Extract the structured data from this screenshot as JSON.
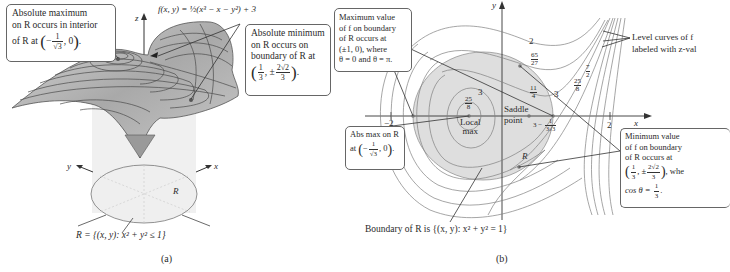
{
  "figure": {
    "panel_a": {
      "caption": "(a)",
      "function_label": "f(x, y) = ½(x³ − x − y²) + 3",
      "axis_labels": {
        "z": "z",
        "x": "x",
        "y": "y"
      },
      "region_label": "R",
      "region_definition": "R = {(x, y): x² + y² ≤ 1}",
      "callouts": {
        "abs_max": {
          "line1": "Absolute maximum",
          "line2": "on R occurs in interior",
          "line3_prefix": "of R at",
          "point_num": "1",
          "point_den": "√3",
          "point_sign": "−",
          "point_suffix": ", 0",
          "end": "."
        },
        "abs_min": {
          "line1": "Absolute minimum",
          "line2": "on R occurs on",
          "line3": "boundary of R at",
          "x_num": "1",
          "x_den": "3",
          "y_sign": "±",
          "y_num": "2√2",
          "y_den": "3",
          "end": "."
        }
      }
    },
    "panel_b": {
      "caption": "(b)",
      "axis_labels": {
        "x": "x",
        "y": "y"
      },
      "ticks": {
        "neg2": "−2",
        "pos2": "2",
        "half": "1/2"
      },
      "region_label": "R",
      "boundary_text": "Boundary of R is {(x, y): x² + y² = 1}",
      "point_labels": {
        "local_max": [
          "Local",
          "max"
        ],
        "saddle": [
          "Saddle",
          "point"
        ]
      },
      "level_labels": {
        "two": "2",
        "sixtyfive_27": {
          "num": "65",
          "den": "27"
        },
        "eleven_4": {
          "num": "11",
          "den": "4"
        },
        "three_a": "3",
        "three_b": "3",
        "three_c": "3",
        "twentyfive_8_left": {
          "num": "25",
          "den": "8"
        },
        "twentyfive_8_right": {
          "num": "25",
          "den": "8"
        },
        "seven_2": {
          "num": "7",
          "den": "2"
        },
        "three_minus": {
          "prefix": "3 −",
          "num": "1",
          "den": "3√3"
        }
      },
      "callouts": {
        "max_boundary": {
          "lines": [
            "Maximum value",
            "of f on boundary",
            "of R occurs at",
            "(±1, 0), where",
            "θ = 0 and θ = π."
          ]
        },
        "abs_max": {
          "line1": "Abs max on R",
          "prefix": "at",
          "num": "1",
          "den": "√3",
          "sign": "−",
          "suffix": ", 0",
          "end": "."
        },
        "min_boundary": {
          "lines": [
            "Minimum value",
            "of f on boundary",
            "of R occurs at"
          ],
          "x_num": "1",
          "x_den": "3",
          "y_sign": "±",
          "y_num": "2√2",
          "y_den": "3",
          "tail": ", whe",
          "cos_prefix": "cos θ =",
          "cos_num": "1",
          "cos_den": "3",
          "end": "."
        },
        "level_curves": {
          "lines": [
            "Level curves of f",
            "labeled with z-val"
          ]
        }
      }
    },
    "colors": {
      "surface": "#b8b8b8",
      "region_fill": "#dcdcdc",
      "ellipse_fill": "#ececec",
      "line": "#444444",
      "contour": "#7a7a7a"
    }
  }
}
